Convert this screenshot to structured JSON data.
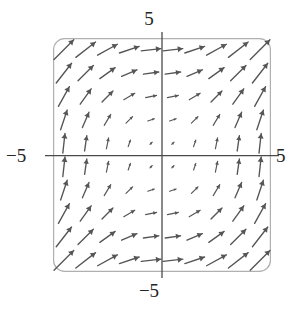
{
  "figure": {
    "title": "",
    "background_color": "#ffffff",
    "frame_color": "#b0b0b0",
    "axis_color": "#4a4a4a",
    "arrow_color": "#555555"
  },
  "axes": {
    "top_label": "5",
    "bottom_label": "−5",
    "left_label": "−5",
    "right_label": "5"
  },
  "chart_data": {
    "type": "scatter",
    "subtype": "vector-field",
    "title": "",
    "xlabel": "",
    "ylabel": "",
    "xlim": [
      -5,
      5
    ],
    "ylim": [
      -5,
      5
    ],
    "xticks": [
      -5,
      5
    ],
    "yticks": [
      -5,
      5
    ],
    "xticklabels": [
      "−5",
      "5"
    ],
    "yticklabels": [
      "−5",
      "5"
    ],
    "grid": false,
    "legend": null,
    "axis_lines": {
      "x_axis_at_y": 0,
      "y_axis_at_x": 0
    },
    "field": {
      "description": "Direction field with arrow direction proportional to (|y|, |x|); all arrows point up and to the right.",
      "u_expression": "abs(y)",
      "v_expression": "abs(x)",
      "sample_x": [
        -4.5,
        -3.5,
        -2.5,
        -1.5,
        -0.5,
        0.5,
        1.5,
        2.5,
        3.5,
        4.5
      ],
      "sample_y": [
        4.5,
        3.5,
        2.5,
        1.5,
        0.5,
        -0.5,
        -1.5,
        -2.5,
        -3.5,
        -4.5
      ],
      "grid_cols": 10,
      "grid_rows": 10
    },
    "vectors": [
      {
        "x": -4.5,
        "y": 4.5,
        "u": 4.5,
        "v": 4.5
      },
      {
        "x": -3.5,
        "y": 4.5,
        "u": 4.5,
        "v": 3.5
      },
      {
        "x": -2.5,
        "y": 4.5,
        "u": 4.5,
        "v": 2.5
      },
      {
        "x": -1.5,
        "y": 4.5,
        "u": 4.5,
        "v": 1.5
      },
      {
        "x": -0.5,
        "y": 4.5,
        "u": 4.5,
        "v": 0.5
      },
      {
        "x": 0.5,
        "y": 4.5,
        "u": 4.5,
        "v": 0.5
      },
      {
        "x": 1.5,
        "y": 4.5,
        "u": 4.5,
        "v": 1.5
      },
      {
        "x": 2.5,
        "y": 4.5,
        "u": 4.5,
        "v": 2.5
      },
      {
        "x": 3.5,
        "y": 4.5,
        "u": 4.5,
        "v": 3.5
      },
      {
        "x": 4.5,
        "y": 4.5,
        "u": 4.5,
        "v": 4.5
      },
      {
        "x": -4.5,
        "y": 3.5,
        "u": 3.5,
        "v": 4.5
      },
      {
        "x": -3.5,
        "y": 3.5,
        "u": 3.5,
        "v": 3.5
      },
      {
        "x": -2.5,
        "y": 3.5,
        "u": 3.5,
        "v": 2.5
      },
      {
        "x": -1.5,
        "y": 3.5,
        "u": 3.5,
        "v": 1.5
      },
      {
        "x": -0.5,
        "y": 3.5,
        "u": 3.5,
        "v": 0.5
      },
      {
        "x": 0.5,
        "y": 3.5,
        "u": 3.5,
        "v": 0.5
      },
      {
        "x": 1.5,
        "y": 3.5,
        "u": 3.5,
        "v": 1.5
      },
      {
        "x": 2.5,
        "y": 3.5,
        "u": 3.5,
        "v": 2.5
      },
      {
        "x": 3.5,
        "y": 3.5,
        "u": 3.5,
        "v": 3.5
      },
      {
        "x": 4.5,
        "y": 3.5,
        "u": 3.5,
        "v": 4.5
      },
      {
        "x": -4.5,
        "y": 2.5,
        "u": 2.5,
        "v": 4.5
      },
      {
        "x": -3.5,
        "y": 2.5,
        "u": 2.5,
        "v": 3.5
      },
      {
        "x": -2.5,
        "y": 2.5,
        "u": 2.5,
        "v": 2.5
      },
      {
        "x": -1.5,
        "y": 2.5,
        "u": 2.5,
        "v": 1.5
      },
      {
        "x": -0.5,
        "y": 2.5,
        "u": 2.5,
        "v": 0.5
      },
      {
        "x": 0.5,
        "y": 2.5,
        "u": 2.5,
        "v": 0.5
      },
      {
        "x": 1.5,
        "y": 2.5,
        "u": 2.5,
        "v": 1.5
      },
      {
        "x": 2.5,
        "y": 2.5,
        "u": 2.5,
        "v": 2.5
      },
      {
        "x": 3.5,
        "y": 2.5,
        "u": 2.5,
        "v": 3.5
      },
      {
        "x": 4.5,
        "y": 2.5,
        "u": 2.5,
        "v": 4.5
      },
      {
        "x": -4.5,
        "y": 1.5,
        "u": 1.5,
        "v": 4.5
      },
      {
        "x": -3.5,
        "y": 1.5,
        "u": 1.5,
        "v": 3.5
      },
      {
        "x": -2.5,
        "y": 1.5,
        "u": 1.5,
        "v": 2.5
      },
      {
        "x": -1.5,
        "y": 1.5,
        "u": 1.5,
        "v": 1.5
      },
      {
        "x": -0.5,
        "y": 1.5,
        "u": 1.5,
        "v": 0.5
      },
      {
        "x": 0.5,
        "y": 1.5,
        "u": 1.5,
        "v": 0.5
      },
      {
        "x": 1.5,
        "y": 1.5,
        "u": 1.5,
        "v": 1.5
      },
      {
        "x": 2.5,
        "y": 1.5,
        "u": 1.5,
        "v": 2.5
      },
      {
        "x": 3.5,
        "y": 1.5,
        "u": 1.5,
        "v": 3.5
      },
      {
        "x": 4.5,
        "y": 1.5,
        "u": 1.5,
        "v": 4.5
      },
      {
        "x": -4.5,
        "y": 0.5,
        "u": 0.5,
        "v": 4.5
      },
      {
        "x": -3.5,
        "y": 0.5,
        "u": 0.5,
        "v": 3.5
      },
      {
        "x": -2.5,
        "y": 0.5,
        "u": 0.5,
        "v": 2.5
      },
      {
        "x": -1.5,
        "y": 0.5,
        "u": 0.5,
        "v": 1.5
      },
      {
        "x": -0.5,
        "y": 0.5,
        "u": 0.5,
        "v": 0.5
      },
      {
        "x": 0.5,
        "y": 0.5,
        "u": 0.5,
        "v": 0.5
      },
      {
        "x": 1.5,
        "y": 0.5,
        "u": 0.5,
        "v": 1.5
      },
      {
        "x": 2.5,
        "y": 0.5,
        "u": 0.5,
        "v": 2.5
      },
      {
        "x": 3.5,
        "y": 0.5,
        "u": 0.5,
        "v": 3.5
      },
      {
        "x": 4.5,
        "y": 0.5,
        "u": 0.5,
        "v": 4.5
      },
      {
        "x": -4.5,
        "y": -0.5,
        "u": 0.5,
        "v": 4.5
      },
      {
        "x": -3.5,
        "y": -0.5,
        "u": 0.5,
        "v": 3.5
      },
      {
        "x": -2.5,
        "y": -0.5,
        "u": 0.5,
        "v": 2.5
      },
      {
        "x": -1.5,
        "y": -0.5,
        "u": 0.5,
        "v": 1.5
      },
      {
        "x": -0.5,
        "y": -0.5,
        "u": 0.5,
        "v": 0.5
      },
      {
        "x": 0.5,
        "y": -0.5,
        "u": 0.5,
        "v": 0.5
      },
      {
        "x": 1.5,
        "y": -0.5,
        "u": 0.5,
        "v": 1.5
      },
      {
        "x": 2.5,
        "y": -0.5,
        "u": 0.5,
        "v": 2.5
      },
      {
        "x": 3.5,
        "y": -0.5,
        "u": 0.5,
        "v": 3.5
      },
      {
        "x": 4.5,
        "y": -0.5,
        "u": 0.5,
        "v": 4.5
      },
      {
        "x": -4.5,
        "y": -1.5,
        "u": 1.5,
        "v": 4.5
      },
      {
        "x": -3.5,
        "y": -1.5,
        "u": 1.5,
        "v": 3.5
      },
      {
        "x": -2.5,
        "y": -1.5,
        "u": 1.5,
        "v": 2.5
      },
      {
        "x": -1.5,
        "y": -1.5,
        "u": 1.5,
        "v": 1.5
      },
      {
        "x": -0.5,
        "y": -1.5,
        "u": 1.5,
        "v": 0.5
      },
      {
        "x": 0.5,
        "y": -1.5,
        "u": 1.5,
        "v": 0.5
      },
      {
        "x": 1.5,
        "y": -1.5,
        "u": 1.5,
        "v": 1.5
      },
      {
        "x": 2.5,
        "y": -1.5,
        "u": 1.5,
        "v": 2.5
      },
      {
        "x": 3.5,
        "y": -1.5,
        "u": 1.5,
        "v": 3.5
      },
      {
        "x": 4.5,
        "y": -1.5,
        "u": 1.5,
        "v": 4.5
      },
      {
        "x": -4.5,
        "y": -2.5,
        "u": 2.5,
        "v": 4.5
      },
      {
        "x": -3.5,
        "y": -2.5,
        "u": 2.5,
        "v": 3.5
      },
      {
        "x": -2.5,
        "y": -2.5,
        "u": 2.5,
        "v": 2.5
      },
      {
        "x": -1.5,
        "y": -2.5,
        "u": 2.5,
        "v": 1.5
      },
      {
        "x": -0.5,
        "y": -2.5,
        "u": 2.5,
        "v": 0.5
      },
      {
        "x": 0.5,
        "y": -2.5,
        "u": 2.5,
        "v": 0.5
      },
      {
        "x": 1.5,
        "y": -2.5,
        "u": 2.5,
        "v": 1.5
      },
      {
        "x": 2.5,
        "y": -2.5,
        "u": 2.5,
        "v": 2.5
      },
      {
        "x": 3.5,
        "y": -2.5,
        "u": 2.5,
        "v": 3.5
      },
      {
        "x": 4.5,
        "y": -2.5,
        "u": 2.5,
        "v": 4.5
      },
      {
        "x": -4.5,
        "y": -3.5,
        "u": 3.5,
        "v": 4.5
      },
      {
        "x": -3.5,
        "y": -3.5,
        "u": 3.5,
        "v": 3.5
      },
      {
        "x": -2.5,
        "y": -3.5,
        "u": 3.5,
        "v": 2.5
      },
      {
        "x": -1.5,
        "y": -3.5,
        "u": 3.5,
        "v": 1.5
      },
      {
        "x": -0.5,
        "y": -3.5,
        "u": 3.5,
        "v": 0.5
      },
      {
        "x": 0.5,
        "y": -3.5,
        "u": 3.5,
        "v": 0.5
      },
      {
        "x": 1.5,
        "y": -3.5,
        "u": 3.5,
        "v": 1.5
      },
      {
        "x": 2.5,
        "y": -3.5,
        "u": 3.5,
        "v": 2.5
      },
      {
        "x": 3.5,
        "y": -3.5,
        "u": 3.5,
        "v": 3.5
      },
      {
        "x": 4.5,
        "y": -3.5,
        "u": 3.5,
        "v": 4.5
      },
      {
        "x": -4.5,
        "y": -4.5,
        "u": 4.5,
        "v": 4.5
      },
      {
        "x": -3.5,
        "y": -4.5,
        "u": 4.5,
        "v": 3.5
      },
      {
        "x": -2.5,
        "y": -4.5,
        "u": 4.5,
        "v": 2.5
      },
      {
        "x": -1.5,
        "y": -4.5,
        "u": 4.5,
        "v": 1.5
      },
      {
        "x": -0.5,
        "y": -4.5,
        "u": 4.5,
        "v": 0.5
      },
      {
        "x": 0.5,
        "y": -4.5,
        "u": 4.5,
        "v": 0.5
      },
      {
        "x": 1.5,
        "y": -4.5,
        "u": 4.5,
        "v": 1.5
      },
      {
        "x": 2.5,
        "y": -4.5,
        "u": 4.5,
        "v": 2.5
      },
      {
        "x": 3.5,
        "y": -4.5,
        "u": 4.5,
        "v": 3.5
      },
      {
        "x": 4.5,
        "y": -4.5,
        "u": 4.5,
        "v": 4.5
      }
    ]
  }
}
